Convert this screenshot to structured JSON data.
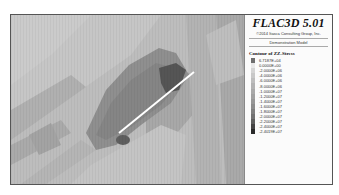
{
  "legend": {
    "title": "FLAC3D 5.01",
    "copyright": "©2014 Itasca Consulting Group, Inc.",
    "model": "Demonstration Model",
    "contour_title": "Contour of ZZ-Stress",
    "entries": [
      {
        "value": "6.7187E+04",
        "color": "#6e6e6e"
      },
      {
        "value": "0.0000E+00",
        "color": "#e8e8e8"
      },
      {
        "value": "-2.0000E+06",
        "color": "#d4d4d4"
      },
      {
        "value": "-4.0000E+06",
        "color": "#c8c8c8"
      },
      {
        "value": "-6.0000E+06",
        "color": "#bdbdbd"
      },
      {
        "value": "-8.0000E+06",
        "color": "#b2b2b2"
      },
      {
        "value": "-1.0000E+07",
        "color": "#a9a9a9"
      },
      {
        "value": "-1.2000E+07",
        "color": "#a0a0a0"
      },
      {
        "value": "-1.4000E+07",
        "color": "#979797"
      },
      {
        "value": "-1.6000E+07",
        "color": "#8c8c8c"
      },
      {
        "value": "-1.8000E+07",
        "color": "#7f7f7f"
      },
      {
        "value": "-2.0000E+07",
        "color": "#717171"
      },
      {
        "value": "-2.2000E+07",
        "color": "#5e5e5e"
      },
      {
        "value": "-2.4000E+07",
        "color": "#444444"
      },
      {
        "value": "-2.4019E+07",
        "color": "#2a2a2a"
      }
    ]
  },
  "plot": {
    "line_color": "#ffffff",
    "background": "#b9b9b9"
  }
}
